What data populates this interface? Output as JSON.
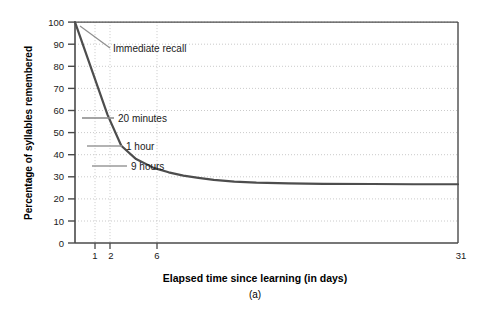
{
  "chart_data": {
    "type": "line",
    "title": "",
    "panel_label": "(a)",
    "xlabel": "Elapsed time since learning (in days)",
    "ylabel": "Percentage of syllables remembered",
    "xlim": [
      0,
      31
    ],
    "ylim": [
      0,
      100
    ],
    "grid": true,
    "legend": "none",
    "x_ticks": [
      {
        "value": 1,
        "label": "1"
      },
      {
        "value": 2,
        "label": "2"
      },
      {
        "value": 6,
        "label": "6"
      },
      {
        "value": 31,
        "label": "31"
      }
    ],
    "y_ticks": [
      {
        "value": 0,
        "label": "0"
      },
      {
        "value": 10,
        "label": "10"
      },
      {
        "value": 20,
        "label": "20"
      },
      {
        "value": 30,
        "label": "30"
      },
      {
        "value": 40,
        "label": "40"
      },
      {
        "value": 50,
        "label": "50"
      },
      {
        "value": 60,
        "label": "60"
      },
      {
        "value": 70,
        "label": "70"
      },
      {
        "value": 80,
        "label": "80"
      },
      {
        "value": 90,
        "label": "90"
      },
      {
        "value": 100,
        "label": "100"
      }
    ],
    "series": [
      {
        "name": "Ebbinghaus forgetting curve",
        "color": "#4d4d4d",
        "x": [
          0.0,
          0.014,
          0.042,
          0.1,
          0.22,
          0.38,
          0.6,
          0.9,
          1.3,
          2.0,
          3.0,
          5.0,
          8.0,
          14.0,
          21.0,
          31.0
        ],
        "y": [
          100,
          58,
          44,
          38,
          34,
          32,
          30.5,
          29.5,
          28.6,
          27.8,
          27.3,
          27.0,
          26.8,
          26.7,
          26.6,
          26.6
        ]
      }
    ],
    "annotations": [
      {
        "label": "Immediate recall",
        "value": 100,
        "time": "immediate",
        "leader": "diagonal"
      },
      {
        "label": "20 minutes",
        "value": 58,
        "time": "20 minutes",
        "leader": "horizontal"
      },
      {
        "label": "1 hour",
        "value": 44,
        "time": "1 hour",
        "leader": "horizontal"
      },
      {
        "label": "9 hours",
        "value": 36,
        "time": "9 hours",
        "leader": "horizontal"
      }
    ]
  },
  "colors": {
    "curve": "#4d4d4d",
    "axis": "#4a4a4a",
    "grid": "#b9b9b9",
    "leader": "#8c8c8c",
    "text": "#1a1a1a",
    "background": "#ffffff"
  }
}
